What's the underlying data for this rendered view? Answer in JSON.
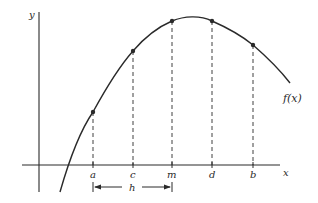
{
  "diagram": {
    "type": "function-plot",
    "axes": {
      "x_label": "x",
      "y_label": "y"
    },
    "curve": {
      "label": "f(x)",
      "shape": "concave-down parabola-like curve with a maximum between m and d"
    },
    "points": [
      {
        "id": "a",
        "label": "a",
        "x_px": 93,
        "y_px": 112
      },
      {
        "id": "c",
        "label": "c",
        "x_px": 133,
        "y_px": 51
      },
      {
        "id": "m",
        "label": "m",
        "x_px": 172,
        "y_px": 21
      },
      {
        "id": "d",
        "label": "d",
        "x_px": 212,
        "y_px": 21
      },
      {
        "id": "b",
        "label": "b",
        "x_px": 253,
        "y_px": 45
      }
    ],
    "interval": {
      "label": "h",
      "from": "a",
      "to": "m"
    },
    "colors": {
      "ink": "#2a2a2a",
      "background": "#ffffff"
    }
  }
}
